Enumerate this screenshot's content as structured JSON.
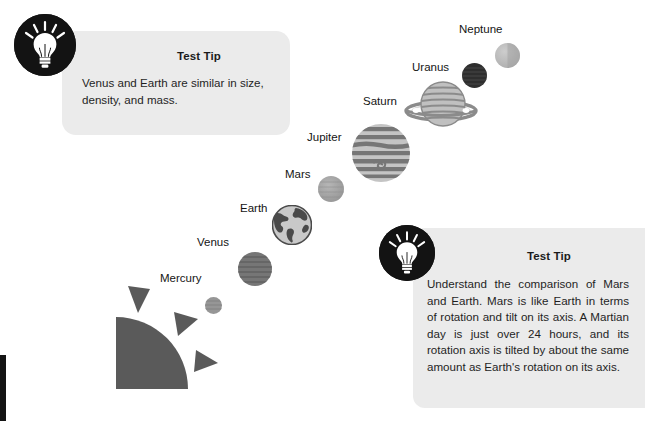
{
  "page": {
    "background": "#ffffff",
    "edge_bar_color": "#141414"
  },
  "tips": [
    {
      "id": "tip-venus-earth",
      "title": "Test Tip",
      "body": "Venus and Earth are similar in size, density, and mass.",
      "icon": "lightbulb-icon",
      "box_color": "#ebebeb"
    },
    {
      "id": "tip-mars-earth",
      "title": "Test Tip",
      "body": "Understand the comparison of Mars and Earth. Mars is like Earth in terms of rotation and tilt on its axis. A Martian day is just over 24 hours, and its rotation axis is tilted by about the same amount as Earth's rotation on its axis.",
      "icon": "lightbulb-icon",
      "box_color": "#ebebeb"
    }
  ],
  "diagram": {
    "sun_label": "sun",
    "planets": [
      {
        "name": "Mercury",
        "color": "#8f8f8f",
        "diameter_px": 17
      },
      {
        "name": "Venus",
        "color": "#737373",
        "diameter_px": 34
      },
      {
        "name": "Earth",
        "color": "#6e6e6e",
        "diameter_px": 40
      },
      {
        "name": "Mars",
        "color": "#a0a0a0",
        "diameter_px": 26
      },
      {
        "name": "Jupiter",
        "color": "#8a8a8a",
        "diameter_px": 58
      },
      {
        "name": "Saturn",
        "color": "#9a9a9a",
        "diameter_px": 45
      },
      {
        "name": "Uranus",
        "color": "#333333",
        "diameter_px": 25
      },
      {
        "name": "Neptune",
        "color": "#b9b9b9",
        "diameter_px": 25
      }
    ]
  }
}
